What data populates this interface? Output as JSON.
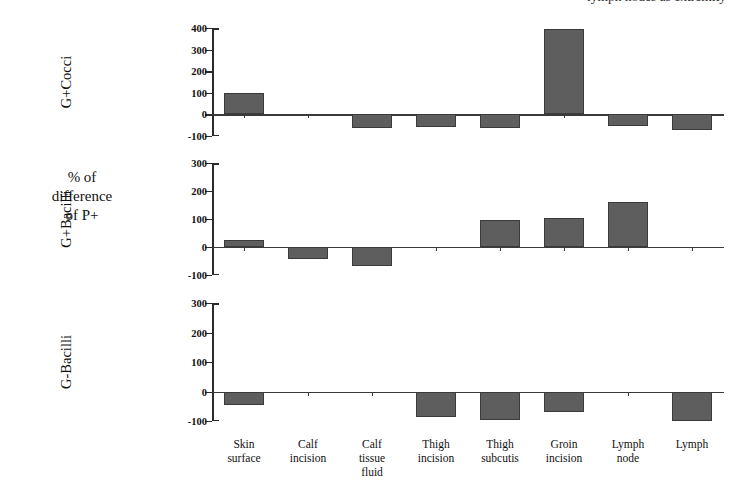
{
  "header": {
    "clipped_text": "lymph nodes as extremity"
  },
  "axis_caption": {
    "line1": "% of",
    "line2": "difference",
    "line3": "of P+"
  },
  "chart_data": {
    "type": "bar",
    "title": "",
    "xlabel": "",
    "ylabel": "% of difference of P+",
    "grid": false,
    "legend": "none",
    "orientation": "vertical",
    "layout": "3 stacked panels sharing one category axis",
    "categories": [
      "Skin surface",
      "Calf incision",
      "Calf tissue fluid",
      "Thigh incision",
      "Thigh subcutis",
      "Groin incision",
      "Lymph node",
      "Lymph"
    ],
    "category_lines": [
      [
        "Skin",
        "surface"
      ],
      [
        "Calf",
        "incision"
      ],
      [
        "Calf",
        "tissue",
        "fluid"
      ],
      [
        "Thigh",
        "incision"
      ],
      [
        "Thigh",
        "subcutis"
      ],
      [
        "Groin",
        "incision"
      ],
      [
        "Lymph",
        "node"
      ],
      [
        "Lymph"
      ]
    ],
    "bar_color": "#5e5e5e",
    "panels": [
      {
        "name": "G+Cocci",
        "ylim": [
          -100,
          400
        ],
        "yticks": [
          400,
          300,
          200,
          100,
          0,
          -100
        ],
        "values": [
          100,
          0,
          -62,
          -58,
          -62,
          395,
          -52,
          -72
        ]
      },
      {
        "name": "G+Bacilli",
        "ylim": [
          -100,
          300
        ],
        "yticks": [
          300,
          200,
          100,
          0,
          -100
        ],
        "values": [
          25,
          -42,
          -68,
          0,
          95,
          105,
          160,
          0
        ]
      },
      {
        "name": "G-Bacilli",
        "ylim": [
          -100,
          300
        ],
        "yticks": [
          300,
          200,
          100,
          0,
          -100
        ],
        "values": [
          -45,
          0,
          0,
          -88,
          -95,
          -68,
          0,
          -100
        ]
      }
    ]
  },
  "panel_geometry": [
    {
      "top": 28,
      "height": 108
    },
    {
      "top": 163,
      "height": 112
    },
    {
      "top": 303,
      "height": 118
    }
  ]
}
